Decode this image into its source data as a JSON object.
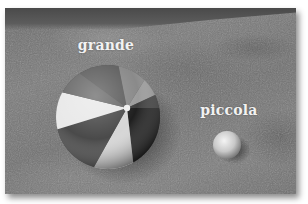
{
  "image": {
    "description": "Grayscale photo of a large beach ball and a small ball lying on sand",
    "colors": {
      "sand": "#747474",
      "label": "#f2f2f2",
      "shadow": "#2a2a2a"
    }
  },
  "labels": {
    "large": "grande",
    "small": "piccola"
  },
  "objects": [
    {
      "name": "beach-ball",
      "size": "large",
      "center": [
        108,
        117
      ],
      "radius": 52
    },
    {
      "name": "small-ball",
      "size": "small",
      "center": [
        227,
        145
      ],
      "radius": 14
    }
  ]
}
